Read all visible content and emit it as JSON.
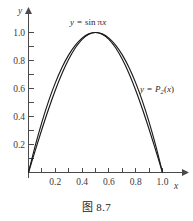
{
  "figure": {
    "caption": "图 8.7"
  },
  "chart_data": {
    "type": "line",
    "title": "",
    "subtitle": "",
    "xlabel": "x",
    "ylabel": "y",
    "xlim": [
      -0.04,
      1.12
    ],
    "ylim": [
      -0.04,
      1.12
    ],
    "grid": false,
    "legend_position": "inline-annotations",
    "xticks": [
      0.2,
      0.4,
      0.6,
      0.8,
      1.0
    ],
    "xtick_labels": [
      "0.2",
      "0.4",
      "0.6",
      "0.8",
      "1.0"
    ],
    "xminor_ticks": [
      0.1,
      0.3,
      0.5,
      0.7,
      0.9
    ],
    "yticks": [
      0.2,
      0.4,
      0.6,
      0.8,
      1.0
    ],
    "ytick_labels": [
      "0.2",
      "0.4",
      "0.6",
      "0.8",
      "1.0"
    ],
    "yminor_ticks": [
      0.1,
      0.3,
      0.5,
      0.7,
      0.9
    ],
    "series": [
      {
        "name": "y = sin πx",
        "label_parts": {
          "lhs": "y",
          "eq": "=",
          "fn": "sin",
          "arg_greek": "π",
          "arg_var": "x"
        },
        "x": [
          0.0,
          0.05,
          0.1,
          0.15,
          0.2,
          0.25,
          0.3,
          0.35,
          0.4,
          0.45,
          0.5,
          0.55,
          0.6,
          0.65,
          0.7,
          0.75,
          0.8,
          0.85,
          0.9,
          0.95,
          1.0
        ],
        "values": [
          0.0,
          0.1564,
          0.309,
          0.454,
          0.5878,
          0.7071,
          0.809,
          0.891,
          0.9511,
          0.9877,
          1.0,
          0.9877,
          0.9511,
          0.891,
          0.809,
          0.7071,
          0.5878,
          0.454,
          0.309,
          0.1564,
          0.0
        ]
      },
      {
        "name": "y = P2(x)",
        "label_parts": {
          "lhs": "y",
          "eq": "=",
          "poly": "P",
          "sub": "2",
          "arg": "(x)"
        },
        "x": [
          0.0,
          0.05,
          0.1,
          0.15,
          0.2,
          0.25,
          0.3,
          0.35,
          0.4,
          0.45,
          0.5,
          0.55,
          0.6,
          0.65,
          0.7,
          0.75,
          0.8,
          0.85,
          0.9,
          0.95,
          1.0
        ],
        "values": [
          0.0,
          0.19,
          0.36,
          0.51,
          0.64,
          0.75,
          0.84,
          0.91,
          0.96,
          0.99,
          1.0,
          0.99,
          0.96,
          0.91,
          0.84,
          0.75,
          0.64,
          0.51,
          0.36,
          0.19,
          0.0
        ]
      }
    ],
    "annotations": [
      {
        "id": "sine-label",
        "text": "y = sin πx",
        "x": 0.38,
        "y": 1.12
      },
      {
        "id": "poly-label",
        "text": "y = P2(x)",
        "x": 0.92,
        "y": 0.6
      }
    ],
    "colors": {
      "curve": "#1a1a1a",
      "axis": "#4a4a4a",
      "tick_text": "#3a3a3a",
      "background": "#ffffff"
    }
  }
}
